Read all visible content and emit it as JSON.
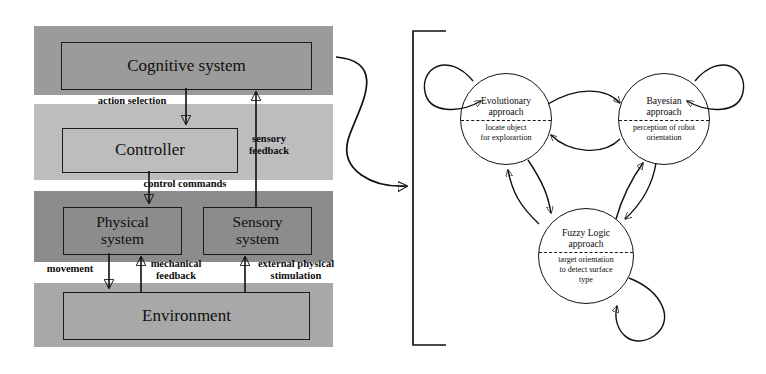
{
  "figure": {
    "type": "diagram"
  },
  "left_panel": {
    "name": "layered-robot-architecture",
    "bands": [
      {
        "id": "cognitive-layer",
        "color": "#9b9b9b"
      },
      {
        "id": "controller-layer",
        "color": "#bdbdbd"
      },
      {
        "id": "physical-sensory-layer",
        "color": "#8c8c8c"
      },
      {
        "id": "environment-layer",
        "color": "#a8a8a8"
      }
    ],
    "boxes": {
      "cognitive": "Cognitive system",
      "controller": "Controller",
      "physical": "Physical\nsystem",
      "physical_line1": "Physical",
      "physical_line2": "system",
      "sensory": "Sensory\nsystem",
      "sensory_line1": "Sensory",
      "sensory_line2": "system",
      "environment": "Environment"
    },
    "edge_labels": {
      "action_selection": "action selection",
      "sensory_feedback_line1": "sensory",
      "sensory_feedback_line2": "feedback",
      "control_commands": "control commands",
      "movement": "movement",
      "mechanical_feedback_line1": "mechanical",
      "mechanical_feedback_line2": "feedback",
      "external_stimulation_line1": "external physical",
      "external_stimulation_line2": "stimulation"
    }
  },
  "right_panel": {
    "name": "approach-state-machine",
    "bracket": "[",
    "states": [
      {
        "id": "evolutionary",
        "title_line1": "Evolutionary",
        "title_line2": "approach",
        "desc_line1": "locate object",
        "desc_line2": "for explorartion"
      },
      {
        "id": "bayesian",
        "title_line1": "Bayesian",
        "title_line2": "approach",
        "desc_line1": "perception of robot",
        "desc_line2": "orientation"
      },
      {
        "id": "fuzzy-logic",
        "title_line1": "Fuzzy Logic",
        "title_line2": "approach",
        "desc_line1": "target orientation",
        "desc_line2": "to detect surface",
        "desc_line3": "type"
      }
    ]
  },
  "colors": {
    "stroke": "#101010",
    "page_background": "#ffffff"
  }
}
